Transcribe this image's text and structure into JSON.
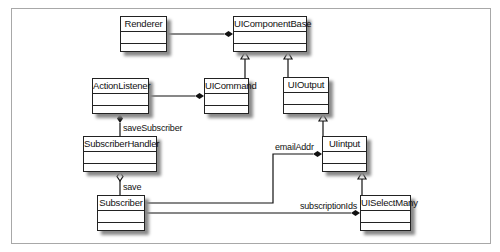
{
  "diagram": {
    "type": "UML class diagram",
    "classes": [
      {
        "id": "renderer",
        "name": "Renderer"
      },
      {
        "id": "uicomponentbase",
        "name": "UIComponentBase"
      },
      {
        "id": "actionlistener",
        "name": "ActionListener"
      },
      {
        "id": "uicommand",
        "name": "UICommand"
      },
      {
        "id": "uioutput",
        "name": "UIOutput"
      },
      {
        "id": "subscriberhandler",
        "name": "SubscriberHandler"
      },
      {
        "id": "uiinput",
        "name": "UIintput"
      },
      {
        "id": "subscriber",
        "name": "Subscriber"
      },
      {
        "id": "uiselectmany",
        "name": "UISelectMany"
      }
    ],
    "relationships": [
      {
        "from": "Renderer",
        "to": "UIComponentBase",
        "kind": "composition",
        "label": ""
      },
      {
        "from": "UICommand",
        "to": "UIComponentBase",
        "kind": "generalization",
        "label": ""
      },
      {
        "from": "UIOutput",
        "to": "UIComponentBase",
        "kind": "generalization",
        "label": ""
      },
      {
        "from": "ActionListener",
        "to": "UICommand",
        "kind": "composition",
        "label": ""
      },
      {
        "from": "SubscriberHandler",
        "to": "ActionListener",
        "kind": "composition",
        "label": "saveSubscriber"
      },
      {
        "from": "UIintput",
        "to": "UIOutput",
        "kind": "generalization",
        "label": ""
      },
      {
        "from": "UISelectMany",
        "to": "UIintput",
        "kind": "generalization",
        "label": ""
      },
      {
        "from": "Subscriber",
        "to": "SubscriberHandler",
        "kind": "aggregation",
        "label": "save"
      },
      {
        "from": "Subscriber",
        "to": "UIintput",
        "kind": "composition",
        "label": "emailAddr"
      },
      {
        "from": "Subscriber",
        "to": "UISelectMany",
        "kind": "composition",
        "label": "subscriptionIds"
      }
    ]
  },
  "labels": {
    "saveSubscriber": "saveSubscriber",
    "save": "save",
    "emailAddr": "emailAddr",
    "subscriptionIds": "subscriptionIds"
  },
  "colors": {
    "line": "#111111",
    "shadow": "#8a8a8a",
    "frame": "#a8a8a8"
  }
}
